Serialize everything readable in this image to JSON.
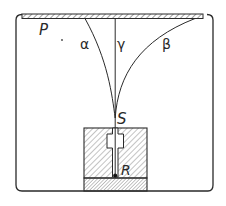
{
  "figure": {
    "labels": {
      "plate": "P",
      "alpha": "α",
      "gamma": "γ",
      "beta": "β",
      "slit": "S",
      "source": "R"
    },
    "colors": {
      "line": "#2a2a2a",
      "hatch": "#555555",
      "background": "#ffffff"
    }
  }
}
